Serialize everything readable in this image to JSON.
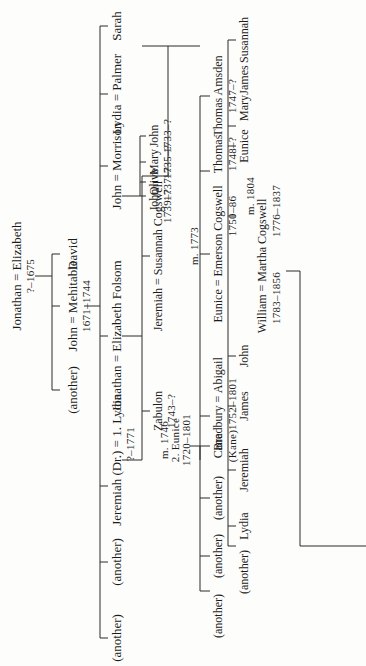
{
  "chart": {
    "type": "family-tree",
    "orientation": "rotated-90-ccw",
    "generation1": {
      "couple": "Jonathan = Elizabeth",
      "dates": "?–1675"
    },
    "generation2": [
      {
        "name": "David"
      },
      {
        "name": "John = Mehitable",
        "dates": "1671–1744"
      },
      {
        "name": "(another)"
      }
    ],
    "generation3": [
      {
        "name": "Sarah"
      },
      {
        "name": "Lydia = Palmer"
      },
      {
        "name": "John = Morrison"
      },
      {
        "name": "Jonathan = Elizabeth Folsom"
      },
      {
        "name": "Jeremiah (Dr.) = 1. Lydia",
        "dates": "?–1771"
      },
      {
        "name": "(another)"
      },
      {
        "name": "(another)"
      }
    ],
    "morrison_children": [
      {
        "name": "John",
        "dates": "1733–?"
      },
      {
        "name": "Mary",
        "dates": "1735–?"
      },
      {
        "name": "Olive",
        "dates": "1737–?"
      },
      {
        "name": "John",
        "dates": "1739–?"
      }
    ],
    "folsom_children": [
      {
        "name": "Jeremiah = Susannah Cogswell"
      },
      {
        "name": "Zabulon",
        "dates": "1743–?"
      }
    ],
    "second_marriage": {
      "married": "m. 1746",
      "spouse": "2. Eunice",
      "dates": "1720–1801"
    },
    "jeremiah_eunice_children": [
      {
        "name": "Thomas Amsden",
        "dates": "1747–?"
      },
      {
        "name": "Thomas",
        "dates": "1748–?"
      },
      {
        "name": "Eunice = Emerson Cogswell",
        "married": "m. 1773",
        "dates": "1750–86"
      },
      {
        "name": "Bradbury = Abigail",
        "dates": "1752–1801"
      },
      {
        "name": "Cane",
        "alt": "(Kane)"
      },
      {
        "name": "(another)"
      },
      {
        "name": "(another)"
      },
      {
        "name": "(another)"
      }
    ],
    "jeremiah_susannah_children": [
      {
        "name": "Susannah"
      },
      {
        "name": "James"
      },
      {
        "name": "Mary"
      },
      {
        "name": "Eunice"
      },
      {
        "name": "William = Martha Cogswell",
        "married": "m. 1804",
        "dates": "1776–1837",
        "spouse_dates": "1783–1856"
      },
      {
        "name": "John"
      },
      {
        "name": "James"
      },
      {
        "name": "Jeremiah"
      },
      {
        "name": "Lydia"
      },
      {
        "name": "(another)"
      }
    ]
  }
}
